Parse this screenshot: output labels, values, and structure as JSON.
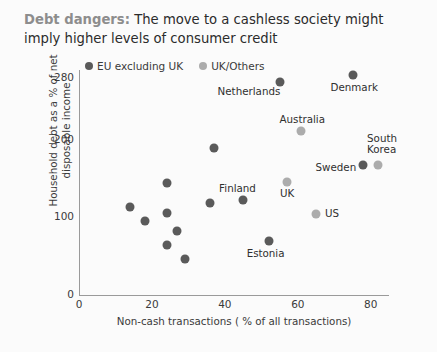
{
  "title": {
    "lead": "Debt dangers:",
    "rest": " The move to a cashless society might imply higher levels of consumer credit"
  },
  "colors": {
    "eu": "#5a5a5a",
    "other": "#acacac",
    "axis": "#9a9a9a",
    "text": "#2f2f2f",
    "title_lead": "#8d8d8d",
    "background": "#fbfbfb"
  },
  "legend": {
    "items": [
      {
        "label": "EU excluding UK",
        "color": "#5a5a5a",
        "series": "eu"
      },
      {
        "label": "UK/Others",
        "color": "#acacac",
        "series": "other"
      }
    ]
  },
  "chart_data": {
    "type": "scatter",
    "title": "Debt dangers: The move to a cashless society might imply higher levels of consumer credit",
    "xlabel": "Non-cash transactions ( % of all transactions)",
    "ylabel": "Household debt as a % of net disposable income",
    "xlim": [
      0,
      85
    ],
    "ylim": [
      0,
      290
    ],
    "xticks": [
      0,
      20,
      40,
      60,
      80
    ],
    "xtick_labels": [
      "0",
      "20",
      "40",
      "60",
      "80"
    ],
    "yticks": [
      0,
      100,
      200,
      280
    ],
    "ytick_labels": [
      "0",
      "100",
      "200",
      "280"
    ],
    "grid": false,
    "legend_position": "top",
    "series": [
      {
        "name": "EU excluding UK",
        "color": "#5a5a5a",
        "points": [
          {
            "label": "Netherlands",
            "x": 55,
            "y": 274,
            "label_dx": -62,
            "label_dy": 10
          },
          {
            "label": "Denmark",
            "x": 75,
            "y": 283,
            "label_dx": -22,
            "label_dy": 13
          },
          {
            "label": "Sweden",
            "x": 78,
            "y": 168,
            "label_dx": -48,
            "label_dy": 3
          },
          {
            "label": "Finland",
            "x": 45,
            "y": 122,
            "label_dx": -24,
            "label_dy": -11
          },
          {
            "label": "Estonia",
            "x": 52,
            "y": 70,
            "label_dx": -22,
            "label_dy": 13
          },
          {
            "label": "",
            "x": 37,
            "y": 190,
            "label_dx": 0,
            "label_dy": 0
          },
          {
            "label": "",
            "x": 36,
            "y": 118,
            "label_dx": 0,
            "label_dy": 0
          },
          {
            "label": "",
            "x": 24,
            "y": 144,
            "label_dx": 0,
            "label_dy": 0
          },
          {
            "label": "",
            "x": 14,
            "y": 113,
            "label_dx": 0,
            "label_dy": 0
          },
          {
            "label": "",
            "x": 18,
            "y": 96,
            "label_dx": 0,
            "label_dy": 0
          },
          {
            "label": "",
            "x": 24,
            "y": 106,
            "label_dx": 0,
            "label_dy": 0
          },
          {
            "label": "",
            "x": 27,
            "y": 82,
            "label_dx": 0,
            "label_dy": 0
          },
          {
            "label": "",
            "x": 24,
            "y": 64,
            "label_dx": 0,
            "label_dy": 0
          },
          {
            "label": "",
            "x": 29,
            "y": 47,
            "label_dx": 0,
            "label_dy": 0
          }
        ]
      },
      {
        "name": "UK/Others",
        "color": "#acacac",
        "points": [
          {
            "label": "Australia",
            "x": 61,
            "y": 212,
            "label_dx": -22,
            "label_dy": -11
          },
          {
            "label": "South\nKorea",
            "x": 82,
            "y": 168,
            "label_dx": -11,
            "label_dy": -26
          },
          {
            "label": "UK",
            "x": 57,
            "y": 146,
            "label_dx": -7,
            "label_dy": 12
          },
          {
            "label": "US",
            "x": 65,
            "y": 105,
            "label_dx": 9,
            "label_dy": 0
          }
        ]
      }
    ]
  }
}
